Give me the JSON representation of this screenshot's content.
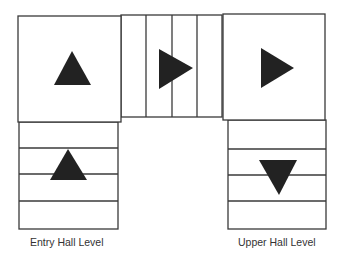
{
  "diagram": {
    "type": "stair-plan",
    "colors": {
      "stroke": "#3a3a3a",
      "arrow": "#222222",
      "label": "#333333",
      "background": "#ffffff"
    },
    "landings": [
      {
        "id": "left-landing",
        "arrow": "up"
      },
      {
        "id": "right-landing",
        "arrow": "right"
      }
    ],
    "middle_flight": {
      "treads": 4,
      "arrow": "right"
    },
    "left_flight": {
      "treads": 4,
      "arrow": "up"
    },
    "right_flight": {
      "treads": 4,
      "arrow": "down"
    },
    "labels": {
      "left": "Entry Hall Level",
      "right": "Upper Hall Level"
    }
  }
}
